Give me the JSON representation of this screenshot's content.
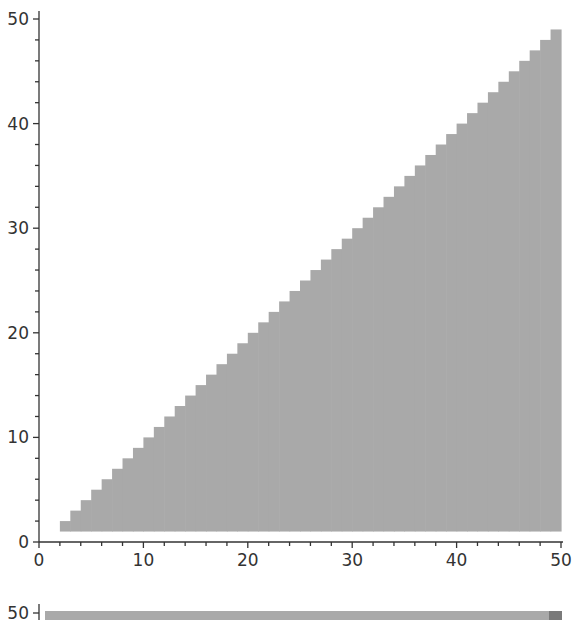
{
  "chart_data": [
    {
      "type": "bar",
      "title": "",
      "xlabel": "",
      "ylabel": "",
      "xlim": [
        0,
        50
      ],
      "ylim": [
        0,
        50
      ],
      "x_ticks": [
        0,
        10,
        20,
        30,
        40,
        50
      ],
      "y_ticks": [
        0,
        10,
        20,
        30,
        40,
        50
      ],
      "minor_tick_step": 2,
      "grid": false,
      "legend": null,
      "description": "Staircase of adjacent unit-width bars; bar at x spans [x, x+1] from y=1 up to y=x",
      "bar_width": 1,
      "baseline": 1,
      "x": [
        2,
        3,
        4,
        5,
        6,
        7,
        8,
        9,
        10,
        11,
        12,
        13,
        14,
        15,
        16,
        17,
        18,
        19,
        20,
        21,
        22,
        23,
        24,
        25,
        26,
        27,
        28,
        29,
        30,
        31,
        32,
        33,
        34,
        35,
        36,
        37,
        38,
        39,
        40,
        41,
        42,
        43,
        44,
        45,
        46,
        47,
        48,
        49
      ],
      "values": [
        2,
        3,
        4,
        5,
        6,
        7,
        8,
        9,
        10,
        11,
        12,
        13,
        14,
        15,
        16,
        17,
        18,
        19,
        20,
        21,
        22,
        23,
        24,
        25,
        26,
        27,
        28,
        29,
        30,
        31,
        32,
        33,
        34,
        35,
        36,
        37,
        38,
        39,
        40,
        41,
        42,
        43,
        44,
        45,
        46,
        47,
        48,
        49
      ],
      "fill_color": "#a9a9a9"
    },
    {
      "type": "bar",
      "partially_visible": true,
      "y_ticks_visible": [
        50
      ],
      "description": "Second chart cut off at bottom; a horizontal band near y=50 spanning the width, with a darker cell at the far right",
      "fill_color": "#a9a9a9",
      "accent_color": "#7a7a7a"
    }
  ],
  "labels": {
    "bottom_chart_top_tick": "50"
  }
}
